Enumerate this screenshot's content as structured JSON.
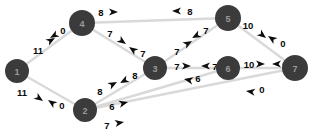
{
  "diagram": {
    "type": "weighted-directed-graph",
    "title": "",
    "canvas": {
      "width": 311,
      "height": 138
    },
    "colors": {
      "node_fill": "#3b3b3b",
      "node_text": "#9a9a9a",
      "edge_line": "#d9d9d9",
      "arrow_head": "#0d0d0d",
      "weight_text": "#0a0a0a",
      "background": "#ffffff"
    },
    "nodes": [
      {
        "id": "1",
        "label": "1",
        "x": 17,
        "y": 71,
        "r": 12
      },
      {
        "id": "2",
        "label": "2",
        "x": 85,
        "y": 110,
        "r": 12
      },
      {
        "id": "3",
        "label": "3",
        "x": 155,
        "y": 68,
        "r": 12
      },
      {
        "id": "4",
        "label": "4",
        "x": 82,
        "y": 23,
        "r": 13
      },
      {
        "id": "5",
        "label": "5",
        "x": 228,
        "y": 18,
        "r": 13
      },
      {
        "id": "6",
        "label": "6",
        "x": 228,
        "y": 68,
        "r": 12
      },
      {
        "id": "7",
        "label": "7",
        "x": 295,
        "y": 68,
        "r": 13
      }
    ],
    "edges": [
      {
        "from": "1",
        "to": "4",
        "weight": "11",
        "label_x": 38,
        "label_y": 50,
        "arrow_x": 55,
        "arrow_y": 38,
        "arrow_angle": -30
      },
      {
        "from": "4",
        "to": "1",
        "weight": "0",
        "label_x": 63,
        "label_y": 30,
        "arrow_x": 50,
        "arrow_y": 38,
        "arrow_angle": 150
      },
      {
        "from": "1",
        "to": "2",
        "weight": "11",
        "label_x": 22,
        "label_y": 92,
        "arrow_x": 43,
        "arrow_y": 101,
        "arrow_angle": 35
      },
      {
        "from": "2",
        "to": "1",
        "weight": "0",
        "label_x": 62,
        "label_y": 105,
        "arrow_x": 48,
        "arrow_y": 100,
        "arrow_angle": 215
      },
      {
        "from": "4",
        "to": "5",
        "weight": "8",
        "label_x": 101,
        "label_y": 12,
        "arrow_x": 118,
        "arrow_y": 12,
        "arrow_angle": 0
      },
      {
        "from": "5",
        "to": "4",
        "weight": "8",
        "label_x": 190,
        "label_y": 11,
        "arrow_x": 172,
        "arrow_y": 11,
        "arrow_angle": 180
      },
      {
        "from": "4",
        "to": "3",
        "weight": "7",
        "label_x": 110,
        "label_y": 33,
        "arrow_x": 126,
        "arrow_y": 44,
        "arrow_angle": 35
      },
      {
        "from": "3",
        "to": "4",
        "weight": "7",
        "label_x": 143,
        "label_y": 53,
        "arrow_x": 129,
        "arrow_y": 47,
        "arrow_angle": 215
      },
      {
        "from": "5",
        "to": "3",
        "weight": "7",
        "label_x": 206,
        "label_y": 30,
        "arrow_x": 192,
        "arrow_y": 38,
        "arrow_angle": 152
      },
      {
        "from": "3",
        "to": "5",
        "weight": "7",
        "label_x": 177,
        "label_y": 51,
        "arrow_x": 192,
        "arrow_y": 41,
        "arrow_angle": -31
      },
      {
        "from": "2",
        "to": "3",
        "weight": "8",
        "label_x": 100,
        "label_y": 91,
        "arrow_x": 117,
        "arrow_y": 82,
        "arrow_angle": -28
      },
      {
        "from": "3",
        "to": "2",
        "weight": "8",
        "label_x": 135,
        "label_y": 75,
        "arrow_x": 120,
        "arrow_y": 83,
        "arrow_angle": 152
      },
      {
        "from": "3",
        "to": "6",
        "weight": "7",
        "label_x": 177,
        "label_y": 66,
        "arrow_x": 191,
        "arrow_y": 66,
        "arrow_angle": 0
      },
      {
        "from": "6",
        "to": "3",
        "weight": "7",
        "label_x": 215,
        "label_y": 66,
        "arrow_x": 201,
        "arrow_y": 66,
        "arrow_angle": 180
      },
      {
        "from": "6",
        "to": "7",
        "weight": "10",
        "label_x": 249,
        "label_y": 64,
        "arrow_x": 265,
        "arrow_y": 64,
        "arrow_angle": 0
      },
      {
        "from": "7",
        "to": "6",
        "weight": "0",
        "label_x": 285,
        "label_y": 64,
        "arrow_x": 272,
        "arrow_y": 64,
        "arrow_angle": 180
      },
      {
        "from": "5",
        "to": "7",
        "weight": "10",
        "label_x": 248,
        "label_y": 25,
        "arrow_x": 266,
        "arrow_y": 38,
        "arrow_angle": 38
      },
      {
        "from": "7",
        "to": "5",
        "weight": "0",
        "label_x": 283,
        "label_y": 43,
        "arrow_x": 268,
        "arrow_y": 36,
        "arrow_angle": 214
      },
      {
        "from": "2",
        "to": "6",
        "weight": "6",
        "label_x": 112,
        "label_y": 106,
        "arrow_x": 128,
        "arrow_y": 102,
        "arrow_angle": -14
      },
      {
        "from": "6",
        "to": "2",
        "weight": "6",
        "label_x": 198,
        "label_y": 78,
        "arrow_x": 184,
        "arrow_y": 79,
        "arrow_angle": 192
      },
      {
        "from": "2",
        "to": "7",
        "weight": "7",
        "label_x": 107,
        "label_y": 125,
        "arrow_x": 124,
        "arrow_y": 122,
        "arrow_angle": -10
      },
      {
        "from": "7",
        "to": "2",
        "weight": "0",
        "label_x": 262,
        "label_y": 89,
        "arrow_x": 246,
        "arrow_y": 91,
        "arrow_angle": 188
      }
    ]
  }
}
